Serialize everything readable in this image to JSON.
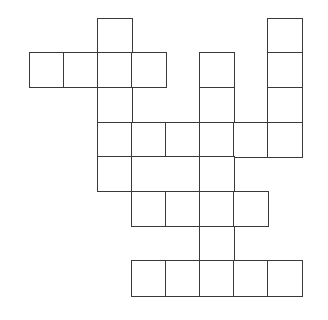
{
  "puzzle": {
    "type": "crossword-grid",
    "origin_x": 29,
    "origin_y": 17.5,
    "cell_width": 34,
    "cell_height": 34.7,
    "line_color": "#3a3a3a",
    "background": "#ffffff",
    "cells": [
      {
        "row": 0,
        "col": 2,
        "span": 1,
        "letter": ""
      },
      {
        "row": 0,
        "col": 7,
        "span": 1,
        "letter": ""
      },
      {
        "row": 1,
        "col": 0,
        "span": 1,
        "letter": ""
      },
      {
        "row": 1,
        "col": 1,
        "span": 1,
        "letter": ""
      },
      {
        "row": 1,
        "col": 2,
        "span": 1,
        "letter": ""
      },
      {
        "row": 1,
        "col": 3,
        "span": 1,
        "letter": ""
      },
      {
        "row": 1,
        "col": 5,
        "span": 1,
        "letter": ""
      },
      {
        "row": 1,
        "col": 7,
        "span": 1,
        "letter": ""
      },
      {
        "row": 2,
        "col": 2,
        "span": 1,
        "letter": ""
      },
      {
        "row": 2,
        "col": 5,
        "span": 1,
        "letter": ""
      },
      {
        "row": 2,
        "col": 7,
        "span": 1,
        "letter": ""
      },
      {
        "row": 3,
        "col": 2,
        "span": 1,
        "letter": ""
      },
      {
        "row": 3,
        "col": 3,
        "span": 1,
        "letter": ""
      },
      {
        "row": 3,
        "col": 4,
        "span": 1,
        "letter": ""
      },
      {
        "row": 3,
        "col": 5,
        "span": 1,
        "letter": ""
      },
      {
        "row": 3,
        "col": 6,
        "span": 1,
        "letter": ""
      },
      {
        "row": 3,
        "col": 7,
        "span": 1,
        "letter": ""
      },
      {
        "row": 4,
        "col": 2,
        "span": 1,
        "letter": ""
      },
      {
        "row": 4,
        "col": 3,
        "span": 2,
        "letter": ""
      },
      {
        "row": 4,
        "col": 5,
        "span": 1,
        "letter": ""
      },
      {
        "row": 5,
        "col": 3,
        "span": 1,
        "letter": ""
      },
      {
        "row": 5,
        "col": 4,
        "span": 1,
        "letter": ""
      },
      {
        "row": 5,
        "col": 5,
        "span": 1,
        "letter": ""
      },
      {
        "row": 5,
        "col": 6,
        "span": 1,
        "letter": ""
      },
      {
        "row": 6,
        "col": 5,
        "span": 1,
        "letter": ""
      },
      {
        "row": 7,
        "col": 3,
        "span": 1,
        "letter": ""
      },
      {
        "row": 7,
        "col": 4,
        "span": 1,
        "letter": ""
      },
      {
        "row": 7,
        "col": 5,
        "span": 1,
        "letter": ""
      },
      {
        "row": 7,
        "col": 6,
        "span": 1,
        "letter": ""
      },
      {
        "row": 7,
        "col": 7,
        "span": 1,
        "letter": ""
      }
    ]
  }
}
